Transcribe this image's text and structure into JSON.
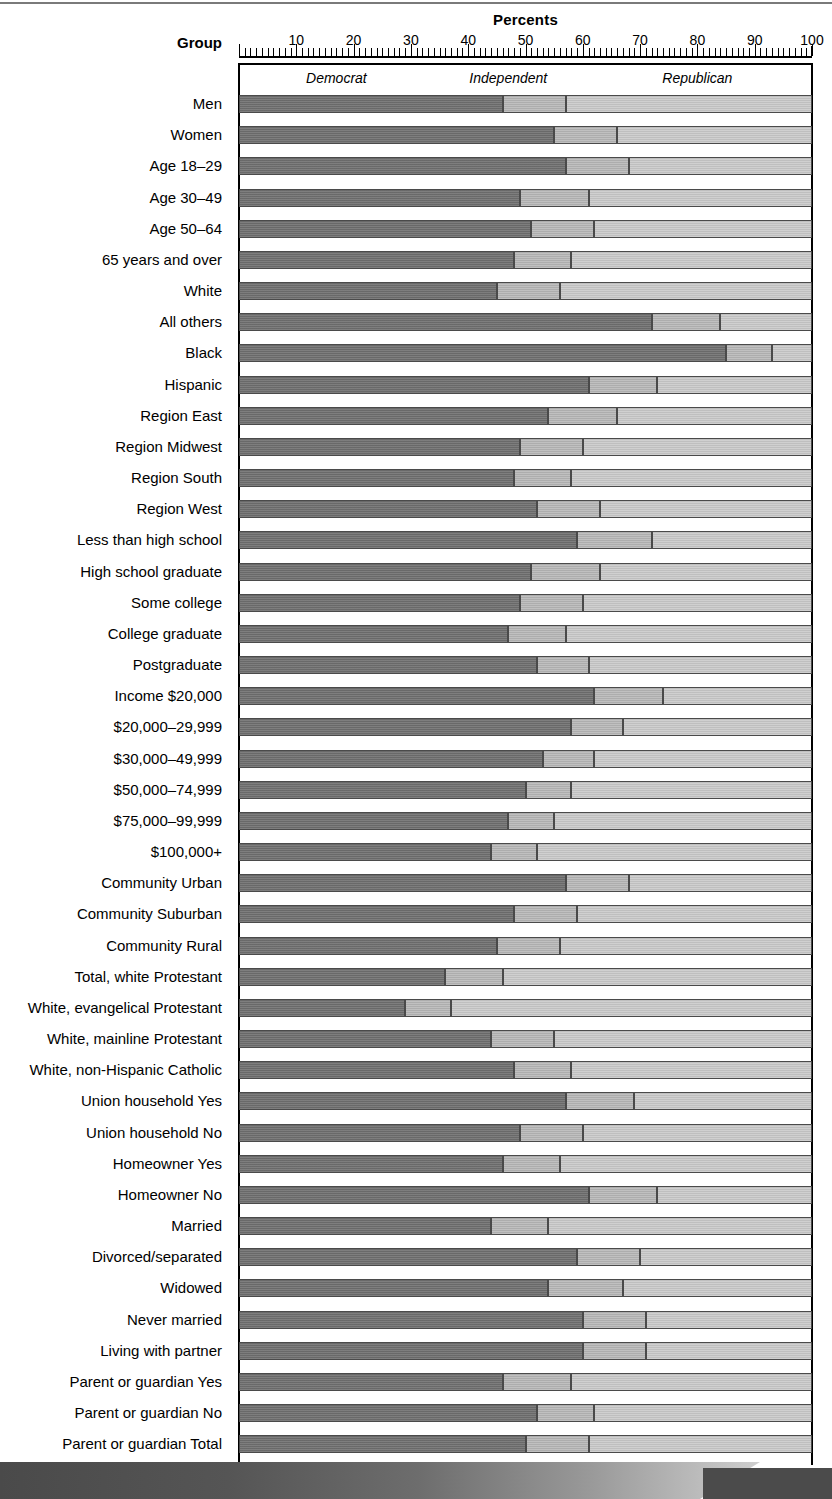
{
  "header": {
    "percents_title": "Percents",
    "group_title": "Group"
  },
  "axis": {
    "ticks": [
      "10",
      "20",
      "30",
      "40",
      "50",
      "60",
      "70",
      "80",
      "90",
      "100"
    ],
    "min": 0,
    "max": 100
  },
  "legend": [
    {
      "label": "Democrat",
      "color": "#6f6f6f"
    },
    {
      "label": "Independent",
      "color": "#b4b4b4"
    },
    {
      "label": "Republican",
      "color": "#c6c6c6"
    }
  ],
  "chart_data": {
    "type": "bar",
    "orientation": "horizontal",
    "stacked": true,
    "normalized_to": 100,
    "title": "Percents",
    "xlabel": "Percents",
    "ylabel": "Group",
    "xlim": [
      0,
      100
    ],
    "grid": false,
    "legend_position": "top-inside",
    "categories": [
      "Men",
      "Women",
      "Age 18–29",
      "Age 30–49",
      "Age 50–64",
      "65 years and over",
      "White",
      "All others",
      "Black",
      "Hispanic",
      "Region East",
      "Region Midwest",
      "Region South",
      "Region West",
      "Less than high school",
      "High school graduate",
      "Some college",
      "College graduate",
      "Postgraduate",
      "Income $20,000",
      "$20,000–29,999",
      "$30,000–49,999",
      "$50,000–74,999",
      "$75,000–99,999",
      "$100,000+",
      "Community Urban",
      "Community Suburban",
      "Community Rural",
      "Total, white Protestant",
      "White, evangelical Protestant",
      "White, mainline Protestant",
      "White, non-Hispanic Catholic",
      "Union household Yes",
      "Union household No",
      "Homeowner Yes",
      "Homeowner No",
      "Married",
      "Divorced/separated",
      "Widowed",
      "Never married",
      "Living with partner",
      "Parent or guardian Yes",
      "Parent or guardian No",
      "Parent or guardian Total"
    ],
    "series": [
      {
        "name": "Democrat",
        "color": "#6f6f6f",
        "values": [
          46,
          55,
          57,
          49,
          51,
          48,
          45,
          72,
          85,
          61,
          54,
          49,
          48,
          52,
          59,
          51,
          49,
          47,
          52,
          62,
          58,
          53,
          50,
          47,
          44,
          57,
          48,
          45,
          36,
          29,
          44,
          48,
          57,
          49,
          46,
          61,
          44,
          59,
          54,
          60,
          60,
          46,
          52,
          50
        ]
      },
      {
        "name": "Independent",
        "color": "#b4b4b4",
        "values": [
          11,
          11,
          11,
          12,
          11,
          10,
          11,
          12,
          8,
          12,
          12,
          11,
          10,
          11,
          13,
          12,
          11,
          10,
          9,
          12,
          9,
          9,
          8,
          8,
          8,
          11,
          11,
          11,
          10,
          8,
          11,
          10,
          12,
          11,
          10,
          12,
          10,
          11,
          13,
          11,
          11,
          12,
          10,
          11
        ]
      },
      {
        "name": "Republican",
        "color": "#c6c6c6",
        "values": [
          43,
          34,
          32,
          39,
          38,
          42,
          44,
          16,
          7,
          27,
          34,
          40,
          42,
          37,
          28,
          37,
          40,
          43,
          39,
          26,
          33,
          38,
          42,
          45,
          48,
          32,
          41,
          44,
          54,
          63,
          45,
          42,
          31,
          40,
          44,
          27,
          46,
          30,
          33,
          29,
          29,
          42,
          38,
          39
        ]
      }
    ]
  }
}
